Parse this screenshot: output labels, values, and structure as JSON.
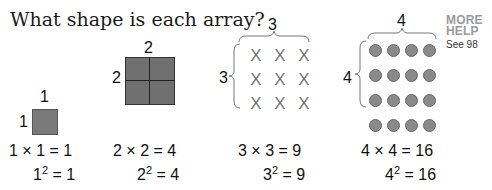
{
  "title": "What shape is each array?",
  "help": {
    "line1": "MORE",
    "line2": "HELP",
    "see": "See 98"
  },
  "arrays": [
    {
      "top": "1",
      "side": "1",
      "product": "1 × 1 = 1",
      "base": "1",
      "exp": "2",
      "square_result": " = 1"
    },
    {
      "top": "2",
      "side": "2",
      "product": "2 × 2 = 4",
      "base": "2",
      "exp": "2",
      "square_result": " = 4"
    },
    {
      "top": "3",
      "side": "3",
      "product": "3 × 3 = 9",
      "base": "3",
      "exp": "2",
      "square_result": " = 9",
      "symbol": "X"
    },
    {
      "top": "4",
      "side": "4",
      "product": "4 × 4 = 16",
      "base": "4",
      "exp": "2",
      "square_result": " = 16",
      "symbol": "dot"
    }
  ]
}
